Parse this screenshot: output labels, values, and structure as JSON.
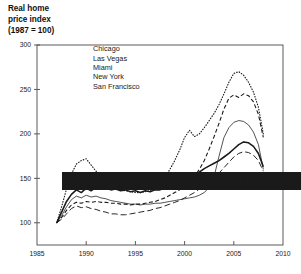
{
  "chart_data": {
    "type": "line",
    "title": "Real home\nprice index\n(1987 = 100)",
    "xlabel": "",
    "ylabel": "",
    "xlim": [
      1985,
      2010
    ],
    "ylim": [
      75,
      300
    ],
    "grid": false,
    "legend_position": "top-left-inside",
    "xticks": [
      "1985",
      "1990",
      "1995",
      "2000",
      "2005",
      "2010"
    ],
    "yticks": [
      "100",
      "150",
      "200",
      "250",
      "300"
    ],
    "x": [
      1987.0,
      1987.5,
      1988.0,
      1988.5,
      1989.0,
      1989.5,
      1990.0,
      1990.5,
      1991.0,
      1991.5,
      1992.0,
      1992.5,
      1993.0,
      1993.5,
      1994.0,
      1994.5,
      1995.0,
      1995.5,
      1996.0,
      1996.5,
      1997.0,
      1997.5,
      1998.0,
      1998.5,
      1999.0,
      1999.5,
      2000.0,
      2000.5,
      2001.0,
      2001.5,
      2002.0,
      2002.5,
      2003.0,
      2003.5,
      2004.0,
      2004.5,
      2005.0,
      2005.5,
      2006.0,
      2006.5,
      2007.0,
      2007.5,
      2008.0
    ],
    "series": [
      {
        "name": "Chicago",
        "style": "solid-thick",
        "values": [
          100,
          112,
          124,
          132,
          137,
          134,
          139,
          136,
          140,
          138,
          139,
          137,
          138,
          136,
          137,
          135,
          136,
          134,
          136,
          135,
          137,
          137,
          139,
          141,
          143,
          145,
          148,
          151,
          154,
          157,
          161,
          164,
          167,
          170,
          174,
          178,
          183,
          188,
          191,
          190,
          186,
          178,
          163
        ]
      },
      {
        "name": "Las Vegas",
        "style": "solid-thin",
        "values": [
          100,
          108,
          118,
          126,
          130,
          128,
          131,
          129,
          130,
          128,
          127,
          125,
          124,
          123,
          122,
          121,
          121,
          120,
          121,
          121,
          122,
          122,
          123,
          124,
          125,
          126,
          127,
          128,
          129,
          131,
          134,
          140,
          152,
          175,
          196,
          207,
          213,
          215,
          214,
          210,
          202,
          188,
          160
        ]
      },
      {
        "name": "Miami",
        "style": "dashed",
        "values": [
          100,
          106,
          114,
          120,
          123,
          122,
          124,
          123,
          124,
          123,
          123,
          122,
          122,
          121,
          121,
          120,
          121,
          121,
          122,
          123,
          124,
          126,
          128,
          131,
          134,
          137,
          141,
          146,
          152,
          160,
          170,
          183,
          197,
          212,
          228,
          240,
          244,
          241,
          245,
          243,
          236,
          222,
          196
        ]
      },
      {
        "name": "New York",
        "style": "longdash",
        "values": [
          100,
          104,
          110,
          116,
          119,
          117,
          118,
          116,
          115,
          113,
          112,
          110,
          110,
          109,
          109,
          110,
          111,
          112,
          113,
          114,
          116,
          117,
          119,
          121,
          123,
          125,
          128,
          131,
          134,
          138,
          142,
          146,
          151,
          156,
          162,
          168,
          174,
          178,
          180,
          179,
          176,
          170,
          158
        ]
      },
      {
        "name": "San Francisco",
        "style": "dotted",
        "values": [
          100,
          118,
          138,
          155,
          166,
          170,
          172,
          165,
          158,
          151,
          146,
          142,
          139,
          137,
          136,
          135,
          134,
          134,
          135,
          136,
          139,
          144,
          151,
          160,
          170,
          182,
          196,
          204,
          197,
          200,
          207,
          215,
          223,
          233,
          245,
          258,
          268,
          270,
          266,
          258,
          247,
          230,
          200
        ]
      }
    ]
  }
}
